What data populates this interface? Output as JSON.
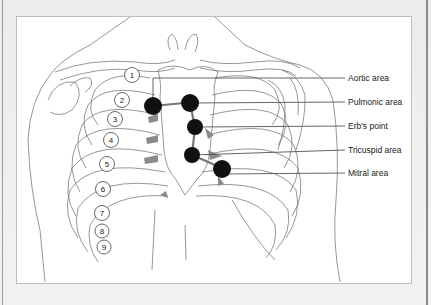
{
  "figure": {
    "title_cut": "• •",
    "labels": [
      {
        "id": "aortic",
        "text": "Aortic area"
      },
      {
        "id": "pulmonic",
        "text": "Pulmonic area"
      },
      {
        "id": "erbs",
        "text": "Erb's point"
      },
      {
        "id": "tricuspid",
        "text": "Tricuspid area"
      },
      {
        "id": "mitral",
        "text": "Mitral area"
      }
    ],
    "rib_numbers": [
      "1",
      "2",
      "3",
      "4",
      "5",
      "6",
      "7",
      "8",
      "9"
    ],
    "colors": {
      "dot": "#111111",
      "connector": "#777777",
      "line": "#555555",
      "shade": "#8a8a8a"
    }
  }
}
